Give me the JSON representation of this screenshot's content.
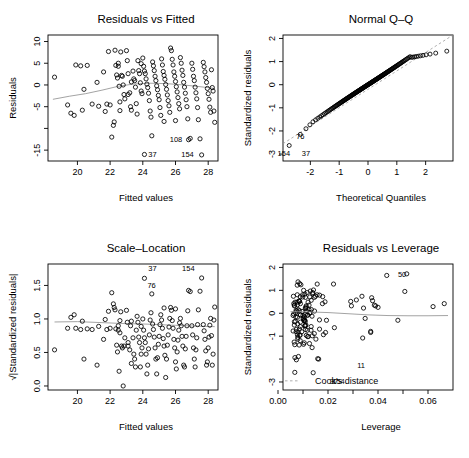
{
  "figure": {
    "name": "regression-diagnostic-plots",
    "background": "#ffffff",
    "point_color": "#000000",
    "smooth_color": "#999999",
    "layout": "2x2"
  },
  "chart_data": [
    {
      "type": "scatter",
      "name": "residuals-vs-fitted",
      "title": "Residuals vs Fitted",
      "xlabel": "Fitted values",
      "ylabel": "Residuals",
      "xlim": [
        18.2,
        28.6
      ],
      "ylim": [
        -17.5,
        11.5
      ],
      "xticks": [
        20,
        22,
        24,
        26,
        28
      ],
      "yticks": [
        10,
        5,
        0,
        -5,
        -10,
        -15
      ],
      "ytick_labels": [
        "10",
        "5",
        "0",
        "-5",
        "",
        "-15"
      ],
      "grid": false,
      "legend": "none",
      "annotations": [
        {
          "label": "37",
          "x": 24.15,
          "y": -16.0,
          "side": "right"
        },
        {
          "label": "108",
          "x": 26.6,
          "y": -12.4,
          "side": "left"
        },
        {
          "label": "154",
          "x": 27.3,
          "y": -16.0,
          "side": "left"
        }
      ],
      "smooth_line": [
        [
          18.5,
          -3.3
        ],
        [
          19.5,
          -2.6
        ],
        [
          20.5,
          -2.0
        ],
        [
          21.5,
          -1.2
        ],
        [
          22.5,
          -0.3
        ],
        [
          23.5,
          0.25
        ],
        [
          24.5,
          0.4
        ],
        [
          25.5,
          0.3
        ],
        [
          26.5,
          0.0
        ],
        [
          27.5,
          -0.4
        ],
        [
          28.4,
          -0.8
        ]
      ],
      "points": [
        [
          18.6,
          1.8
        ],
        [
          19.4,
          -4.6
        ],
        [
          19.6,
          -6.5
        ],
        [
          19.8,
          -7.0
        ],
        [
          19.9,
          4.6
        ],
        [
          20.2,
          4.4
        ],
        [
          20.3,
          -5.8
        ],
        [
          20.4,
          -1.0
        ],
        [
          20.6,
          4.5
        ],
        [
          20.9,
          -4.4
        ],
        [
          21.2,
          0.6
        ],
        [
          21.3,
          -4.9
        ],
        [
          21.6,
          3.0
        ],
        [
          21.8,
          -4.4
        ],
        [
          21.9,
          7.7
        ],
        [
          22.0,
          -4.6
        ],
        [
          22.1,
          -12.0
        ],
        [
          22.2,
          -9.3
        ],
        [
          22.25,
          -8.5
        ],
        [
          22.3,
          8.0
        ],
        [
          22.35,
          4.5
        ],
        [
          22.4,
          2.3
        ],
        [
          22.45,
          1.6
        ],
        [
          22.5,
          5.0
        ],
        [
          22.5,
          4.3
        ],
        [
          22.55,
          -0.3
        ],
        [
          22.6,
          -5.9
        ],
        [
          22.65,
          7.6
        ],
        [
          22.7,
          2.2
        ],
        [
          22.75,
          2.0
        ],
        [
          22.8,
          0.0
        ],
        [
          22.85,
          -2.2
        ],
        [
          22.9,
          -3.2
        ],
        [
          23.0,
          7.9
        ],
        [
          23.05,
          5.6
        ],
        [
          23.1,
          2.6
        ],
        [
          23.2,
          -1.8
        ],
        [
          23.25,
          -5.0
        ],
        [
          23.3,
          -5.8
        ],
        [
          23.4,
          3.2
        ],
        [
          23.45,
          1.4
        ],
        [
          23.5,
          1.0
        ],
        [
          23.55,
          -0.5
        ],
        [
          23.6,
          -4.3
        ],
        [
          23.65,
          -6.7
        ],
        [
          23.7,
          5.6
        ],
        [
          23.75,
          3.3
        ],
        [
          23.8,
          2.6
        ],
        [
          23.85,
          0.5
        ],
        [
          23.9,
          -1.4
        ],
        [
          23.95,
          -2.0
        ],
        [
          24.0,
          6.2
        ],
        [
          24.05,
          4.3
        ],
        [
          24.1,
          3.2
        ],
        [
          24.15,
          2.6
        ],
        [
          24.2,
          1.4
        ],
        [
          24.25,
          0.2
        ],
        [
          24.3,
          -0.6
        ],
        [
          24.35,
          -1.9
        ],
        [
          24.4,
          -3.6
        ],
        [
          24.45,
          -6.0
        ],
        [
          24.5,
          -7.4
        ],
        [
          24.55,
          -11.7
        ],
        [
          24.6,
          5.3
        ],
        [
          24.65,
          4.4
        ],
        [
          24.7,
          3.3
        ],
        [
          24.75,
          2.0
        ],
        [
          24.8,
          1.0
        ],
        [
          24.85,
          -0.2
        ],
        [
          24.9,
          -1.1
        ],
        [
          24.95,
          -2.4
        ],
        [
          25.0,
          -3.4
        ],
        [
          25.05,
          -5.2
        ],
        [
          25.1,
          -7.0
        ],
        [
          25.15,
          6.0
        ],
        [
          25.2,
          4.6
        ],
        [
          25.25,
          3.1
        ],
        [
          25.3,
          2.2
        ],
        [
          25.35,
          1.3
        ],
        [
          25.4,
          0.1
        ],
        [
          25.45,
          -1.0
        ],
        [
          25.5,
          -2.3
        ],
        [
          25.55,
          -3.6
        ],
        [
          25.6,
          -4.8
        ],
        [
          25.65,
          -6.3
        ],
        [
          25.7,
          8.5
        ],
        [
          25.75,
          7.9
        ],
        [
          25.8,
          5.9
        ],
        [
          25.85,
          4.6
        ],
        [
          25.9,
          3.0
        ],
        [
          25.95,
          2.0
        ],
        [
          26.0,
          0.8
        ],
        [
          26.05,
          -0.4
        ],
        [
          26.1,
          -1.6
        ],
        [
          26.15,
          -2.9
        ],
        [
          26.2,
          -4.3
        ],
        [
          26.25,
          -5.5
        ],
        [
          26.3,
          6.3
        ],
        [
          26.35,
          5.0
        ],
        [
          26.4,
          3.4
        ],
        [
          26.45,
          2.2
        ],
        [
          26.5,
          0.6
        ],
        [
          26.55,
          -0.5
        ],
        [
          26.6,
          -1.9
        ],
        [
          26.65,
          -3.4
        ],
        [
          26.7,
          -5.0
        ],
        [
          26.75,
          -7.8
        ],
        [
          26.8,
          -12.6
        ],
        [
          26.9,
          -12.3
        ],
        [
          27.0,
          5.0
        ],
        [
          27.05,
          3.6
        ],
        [
          27.1,
          2.0
        ],
        [
          27.15,
          1.0
        ],
        [
          27.2,
          -0.5
        ],
        [
          27.25,
          -1.8
        ],
        [
          27.3,
          -3.2
        ],
        [
          27.35,
          -5.2
        ],
        [
          27.4,
          -8.0
        ],
        [
          27.5,
          -12.4
        ],
        [
          27.6,
          -16.1
        ],
        [
          27.7,
          5.2
        ],
        [
          27.75,
          4.2
        ],
        [
          27.8,
          3.0
        ],
        [
          27.85,
          1.7
        ],
        [
          27.9,
          0.6
        ],
        [
          27.95,
          -0.8
        ],
        [
          28.0,
          -2.0
        ],
        [
          28.05,
          -3.3
        ],
        [
          28.1,
          -5.1
        ],
        [
          28.15,
          -6.3
        ],
        [
          28.2,
          3.5
        ],
        [
          28.25,
          -0.6
        ],
        [
          28.3,
          -1.4
        ],
        [
          28.35,
          -6.0
        ],
        [
          28.4,
          -8.6
        ],
        [
          24.1,
          -16.0
        ],
        [
          23.1,
          -2.2
        ],
        [
          23.3,
          0.7
        ],
        [
          22.6,
          -3.9
        ],
        [
          21.7,
          -6.1
        ],
        [
          25.3,
          -8.4
        ],
        [
          26.0,
          -8.2
        ],
        [
          23.9,
          4.9
        ]
      ]
    },
    {
      "type": "scatter",
      "name": "normal-qq",
      "title": "Normal Q–Q",
      "xlabel": "Theoretical Quantiles",
      "ylabel": "Standardized residuals",
      "xlim": [
        -2.95,
        2.95
      ],
      "ylim": [
        -3.3,
        2.15
      ],
      "xticks": [
        -2,
        -1,
        0,
        1,
        2
      ],
      "yticks": [
        2,
        1,
        0,
        -1,
        -2,
        -3
      ],
      "ytick_labels": [
        "2",
        "1",
        "0",
        "-1",
        "-2",
        "-3"
      ],
      "grid": false,
      "legend": "none",
      "reference_line": [
        [
          -2.95,
          -2.55
        ],
        [
          2.95,
          2.15
        ]
      ],
      "annotations": [
        {
          "label": "76",
          "x": -2.1,
          "y": -2.22,
          "side": "left"
        },
        {
          "label": "154",
          "x": -2.6,
          "y": -2.95,
          "side": "left"
        },
        {
          "label": "37",
          "x": -2.4,
          "y": -2.95,
          "side": "right"
        }
      ],
      "n_points": 160
    },
    {
      "type": "scatter",
      "name": "scale-location",
      "title": "Scale–Location",
      "xlabel": "Fitted values",
      "ylabel": "√|Standardized residuals|",
      "xlim": [
        18.2,
        28.6
      ],
      "ylim": [
        -0.06,
        1.82
      ],
      "xticks": [
        20,
        22,
        24,
        26,
        28
      ],
      "yticks": [
        0.0,
        0.5,
        1.0,
        1.5
      ],
      "ytick_labels": [
        "0.0",
        "0.5",
        "1.0",
        "1.5"
      ],
      "grid": false,
      "legend": "none",
      "annotations": [
        {
          "label": "37",
          "x": 24.15,
          "y": 1.76,
          "side": "right"
        },
        {
          "label": "154",
          "x": 27.35,
          "y": 1.76,
          "side": "left"
        },
        {
          "label": "76",
          "x": 24.1,
          "y": 1.5,
          "side": "right"
        }
      ],
      "smooth_line": [
        [
          18.6,
          0.955
        ],
        [
          20.0,
          0.96
        ],
        [
          21.5,
          0.945
        ],
        [
          23.0,
          0.93
        ],
        [
          24.0,
          0.925
        ],
        [
          25.0,
          0.915
        ],
        [
          26.0,
          0.905
        ],
        [
          27.0,
          0.895
        ],
        [
          28.4,
          0.885
        ]
      ]
    },
    {
      "type": "scatter",
      "name": "residuals-vs-leverage",
      "title": "Residuals vs Leverage",
      "xlabel": "Leverage",
      "ylabel": "Standardized residuals",
      "xlim": [
        0.002,
        0.07
      ],
      "ylim": [
        -3.35,
        2.15
      ],
      "xticks": [
        0.0,
        0.01,
        0.02,
        0.03,
        0.04,
        0.05,
        0.06
      ],
      "xtick_labels": [
        "0.00",
        "",
        "0.02",
        "",
        "0.04",
        "",
        "0.06"
      ],
      "yticks": [
        2,
        1,
        0,
        -1,
        -2,
        -3
      ],
      "ytick_labels": [
        "2",
        "1",
        "0",
        "-1",
        "",
        "-3"
      ],
      "grid": false,
      "legend": "Cook's distance",
      "annotations": [
        {
          "label": "50",
          "x": 0.0525,
          "y": 1.7,
          "side": "left"
        },
        {
          "label": "11",
          "x": 0.0305,
          "y": -2.27,
          "side": "right"
        },
        {
          "label": "154",
          "x": 0.0205,
          "y": -2.95,
          "side": "right"
        },
        {
          "label": "37",
          "x": 0.0195,
          "y": -2.95,
          "side": "right"
        }
      ],
      "smooth_line": [
        [
          0.005,
          0.07
        ],
        [
          0.012,
          0.06
        ],
        [
          0.02,
          0.03
        ],
        [
          0.028,
          -0.02
        ],
        [
          0.036,
          -0.07
        ],
        [
          0.044,
          -0.1
        ],
        [
          0.052,
          -0.11
        ],
        [
          0.06,
          -0.11
        ],
        [
          0.068,
          -0.1
        ]
      ]
    }
  ]
}
